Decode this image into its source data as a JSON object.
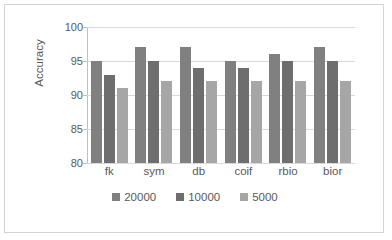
{
  "chart_data": {
    "type": "bar",
    "title": "",
    "xlabel": "",
    "ylabel": "Accuracy",
    "ylim": [
      80,
      100
    ],
    "yticks": [
      80,
      85,
      90,
      95,
      100
    ],
    "grid": true,
    "legend_position": "bottom",
    "categories": [
      "fk",
      "sym",
      "db",
      "coif",
      "rbio",
      "bior"
    ],
    "series": [
      {
        "name": "20000",
        "color": "#808080",
        "values": [
          95,
          97,
          97,
          95,
          96,
          97
        ]
      },
      {
        "name": "10000",
        "color": "#6e6e6e",
        "values": [
          93,
          95,
          94,
          94,
          95,
          95
        ]
      },
      {
        "name": "5000",
        "color": "#a6a6a6",
        "values": [
          91,
          92,
          92,
          92,
          92,
          92
        ]
      }
    ]
  },
  "axis": {
    "y_title": "Accuracy",
    "y_tick_labels": [
      "100",
      "95",
      "90",
      "85",
      "80"
    ],
    "x_tick_labels": [
      "fk",
      "sym",
      "db",
      "coif",
      "rbio",
      "bior"
    ]
  },
  "legend": {
    "entries": [
      {
        "label": "20000",
        "color": "#808080"
      },
      {
        "label": "10000",
        "color": "#6e6e6e"
      },
      {
        "label": "5000",
        "color": "#a6a6a6"
      }
    ]
  },
  "colors": {
    "frame_border": "#d4d4d4",
    "gridline": "#d9d9d9",
    "axis": "#bfbfbf",
    "text": "#595959",
    "background": "#ffffff"
  }
}
